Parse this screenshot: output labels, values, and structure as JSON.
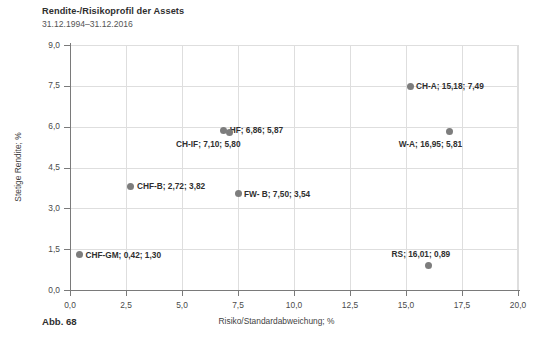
{
  "header": {
    "title": "Rendite-/Risikoprofil der Assets",
    "subtitle": "31.12.1994–31.12.2016",
    "caption": "Abb. 68"
  },
  "chart_data": {
    "type": "scatter",
    "title": "Rendite-/Risikoprofil der Assets",
    "subtitle": "31.12.1994–31.12.2016",
    "xlabel": "Risiko/Standardabweichung; %",
    "ylabel": "Stetige Rendite; %",
    "xlim": [
      0,
      20
    ],
    "ylim": [
      0,
      9
    ],
    "xticks": [
      0,
      2.5,
      5,
      7.5,
      10,
      12.5,
      15,
      17.5,
      20
    ],
    "yticks": [
      0,
      1.5,
      3,
      4.5,
      6,
      7.5,
      9
    ],
    "xticklabels": [
      "0,0",
      "2,5",
      "5,0",
      "7,5",
      "10,0",
      "12,5",
      "15,0",
      "17,5",
      "20,0"
    ],
    "yticklabels": [
      "0,0",
      "1,5",
      "3,0",
      "4,5",
      "6,0",
      "7,5",
      "9,0"
    ],
    "grid": true,
    "legend": "none",
    "marker_color": "#7d7d7d",
    "points": [
      {
        "name": "CHF-GM",
        "x": 0.42,
        "y": 1.3,
        "label": "CHF-GM; 0,42; 1,30",
        "label_pos": "right"
      },
      {
        "name": "CHF-B",
        "x": 2.72,
        "y": 3.82,
        "label": "CHF-B; 2,72; 3,82",
        "label_pos": "right"
      },
      {
        "name": "HF",
        "x": 6.86,
        "y": 5.87,
        "label": "HF; 6,86; 5,87",
        "label_pos": "right"
      },
      {
        "name": "CH-IF",
        "x": 7.1,
        "y": 5.8,
        "label": "CH-IF; 7,10; 5,80",
        "label_pos": "below-left"
      },
      {
        "name": "FW- B",
        "x": 7.5,
        "y": 3.54,
        "label": "FW- B; 7,50; 3,54",
        "label_pos": "right"
      },
      {
        "name": "CH-A",
        "x": 15.18,
        "y": 7.49,
        "label": "CH-A; 15,18; 7,49",
        "label_pos": "right"
      },
      {
        "name": "RS",
        "x": 16.01,
        "y": 0.89,
        "label": "RS; 16,01; 0,89",
        "label_pos": "above-left"
      },
      {
        "name": "W-A",
        "x": 16.95,
        "y": 5.81,
        "label": "W-A; 16,95; 5,81",
        "label_pos": "below-left"
      }
    ]
  },
  "colors": {
    "marker": "#7d7d7d",
    "grid": "#dedede",
    "axis": "#7a7a7a",
    "text": "#3a3a3a",
    "background": "#ffffff"
  }
}
